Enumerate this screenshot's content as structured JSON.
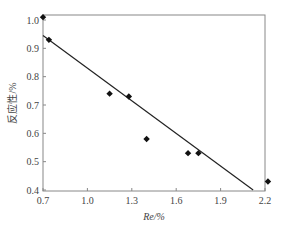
{
  "chart_data": {
    "type": "scatter",
    "title": "",
    "xlabel": "Re/%",
    "ylabel": "反应性/%",
    "xlim": [
      0.7,
      2.2
    ],
    "ylim": [
      0.4,
      1.0
    ],
    "xticks": [
      "0.7",
      "1.0",
      "1.3",
      "1.6",
      "1.9",
      "2.2"
    ],
    "yticks": [
      "0.4",
      "0.5",
      "0.6",
      "0.7",
      "0.8",
      "0.9",
      "1.0"
    ],
    "grid": false,
    "legend": null,
    "series": [
      {
        "name": "data",
        "marker": "diamond",
        "x": [
          0.7,
          0.74,
          1.15,
          1.28,
          1.4,
          1.68,
          1.75,
          2.22
        ],
        "y": [
          1.01,
          0.93,
          0.74,
          0.73,
          0.58,
          0.53,
          0.53,
          0.43
        ]
      },
      {
        "name": "fit",
        "type": "line",
        "x": [
          0.7,
          2.12
        ],
        "y": [
          0.945,
          0.4
        ]
      }
    ]
  }
}
